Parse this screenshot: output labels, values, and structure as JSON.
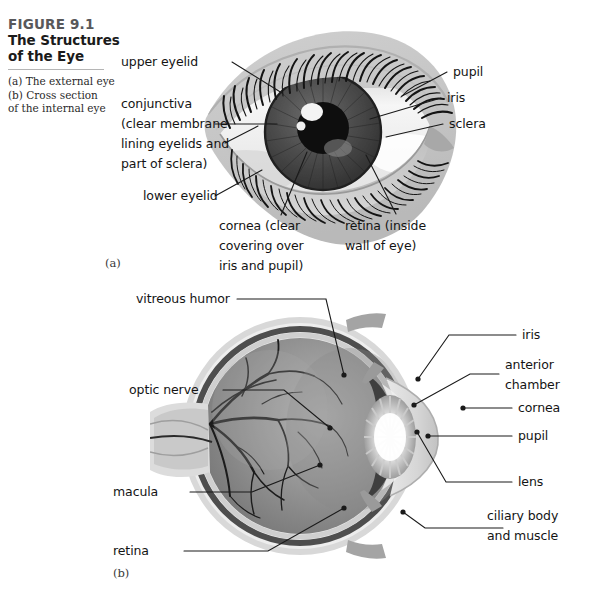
{
  "figure": {
    "number": "FIGURE 9.1",
    "title_line1": "The Structures",
    "title_line2": "of the Eye",
    "caption_a": "(a) The external eye",
    "caption_b_line1": "(b) Cross section",
    "caption_b_line2": "of the internal eye"
  },
  "panels": {
    "a": {
      "tag": "(a)",
      "name": "external eye"
    },
    "b": {
      "tag": "(b)",
      "name": "cross section of the internal eye"
    }
  },
  "panel_a_labels": {
    "upper_eyelid": "upper eyelid",
    "conjunctiva_l1": "conjunctiva",
    "conjunctiva_l2": "(clear membrane",
    "conjunctiva_l3": "lining eyelids and",
    "conjunctiva_l4": "part of sclera)",
    "lower_eyelid": "lower eyelid",
    "cornea_l1": "cornea (clear",
    "cornea_l2": "covering over",
    "cornea_l3": "iris and pupil)",
    "retina_l1": "retina (inside",
    "retina_l2": "wall of eye)",
    "pupil": "pupil",
    "iris": "iris",
    "sclera": "sclera"
  },
  "panel_b_labels": {
    "vitreous_humor": "vitreous humor",
    "optic_nerve": "optic nerve",
    "macula": "macula",
    "retina": "retina",
    "iris": "iris",
    "anterior_chamber_l1": "anterior",
    "anterior_chamber_l2": "chamber",
    "cornea": "cornea",
    "pupil": "pupil",
    "lens": "lens",
    "ciliary_l1": "ciliary body",
    "ciliary_l2": "and muscle"
  },
  "colors": {
    "background": "#ffffff",
    "leader_line": "#1a1a1a",
    "skin": "#c7c7c7",
    "sclera_white": "#f2f2f2",
    "iris_dark": "#4a4a4a",
    "pupil_black": "#111111",
    "eyeball_wall": "#5d5d5d",
    "vitreous": "#8e8e8e",
    "lens_highlight": "#fdfdfd",
    "text": "#141414",
    "fig_number": "#58585a",
    "rule": "#b5b5b5"
  }
}
